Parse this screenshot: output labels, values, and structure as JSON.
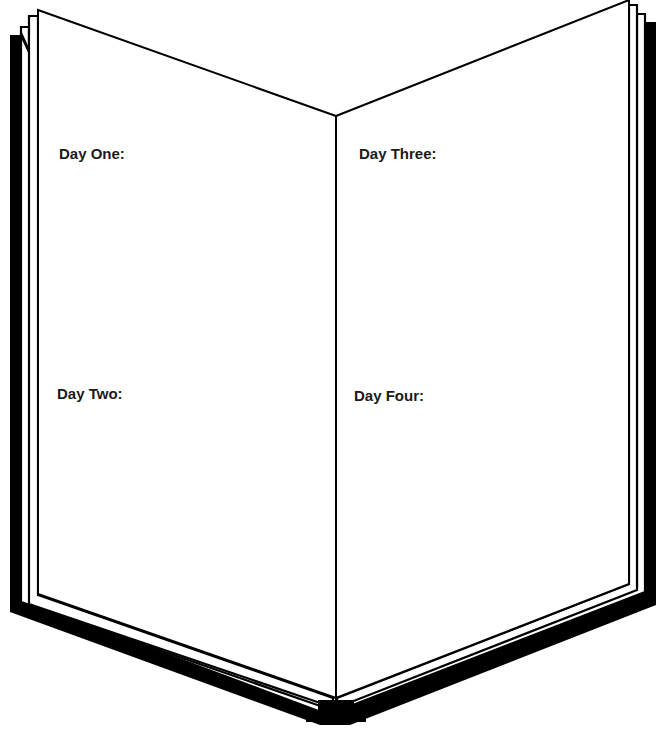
{
  "worksheet": {
    "type": "open-book journal organizer",
    "left_page": {
      "sections": [
        {
          "label": "Day One:"
        },
        {
          "label": "Day Two:"
        }
      ]
    },
    "right_page": {
      "sections": [
        {
          "label": "Day Three:"
        },
        {
          "label": "Day Four:"
        }
      ]
    }
  },
  "colors": {
    "ink": "#000000",
    "page": "#ffffff",
    "text": "#1a1a1a"
  }
}
